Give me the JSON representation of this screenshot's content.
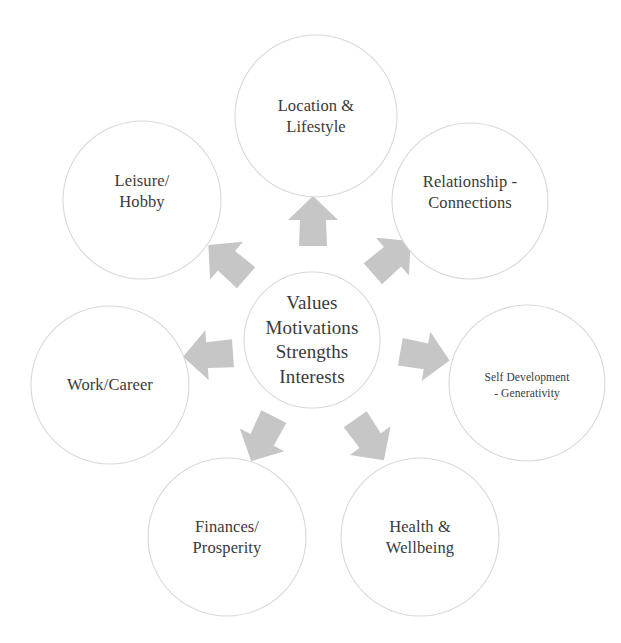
{
  "diagram": {
    "type": "radial-hub-and-spoke",
    "background_color": "#ffffff",
    "circle_stroke_color": "#d8d8d8",
    "circle_fill_color": "#ffffff",
    "arrow_fill_color": "#c6c6c6",
    "text_color": "#3a3a3a",
    "hub": {
      "label": "Values\nMotivations\nStrengths\nInterests",
      "lines": [
        "Values",
        "Motivations",
        "Strengths",
        "Interests"
      ],
      "cx": 312,
      "cy": 340,
      "r": 68
    },
    "nodes": [
      {
        "id": "location-lifestyle",
        "label": "Location &\nLifestyle",
        "lines": [
          "Location &",
          "Lifestyle"
        ],
        "cx": 316,
        "cy": 116,
        "r": 81,
        "text_size": "normal",
        "label_dy": 0
      },
      {
        "id": "relationship-connections",
        "label": "Relationship -\nConnections",
        "lines": [
          "Relationship -",
          "Connections"
        ],
        "cx": 470,
        "cy": 201,
        "r": 78,
        "text_size": "normal",
        "label_dy": -9
      },
      {
        "id": "self-development-generativity",
        "label": "Self Development\n-  Generativity",
        "lines": [
          "Self Development",
          "-  Generativity"
        ],
        "cx": 527,
        "cy": 383,
        "r": 78,
        "text_size": "small",
        "label_dy": 3
      },
      {
        "id": "health-wellbeing",
        "label": "Health &\nWellbeing",
        "lines": [
          "Health &",
          "Wellbeing"
        ],
        "cx": 420,
        "cy": 537,
        "r": 79,
        "text_size": "normal",
        "label_dy": 0
      },
      {
        "id": "finances-prosperity",
        "label": "Finances/\nProsperity",
        "lines": [
          "Finances/",
          "Prosperity"
        ],
        "cx": 227,
        "cy": 537,
        "r": 79,
        "text_size": "normal",
        "label_dy": 0
      },
      {
        "id": "work-career",
        "label": "Work/Career",
        "lines": [
          "Work/Career"
        ],
        "cx": 110,
        "cy": 385,
        "r": 79,
        "text_size": "normal",
        "label_dy": 0
      },
      {
        "id": "leisure-hobby",
        "label": "Leisure/\nHobby",
        "lines": [
          "Leisure/",
          "Hobby"
        ],
        "cx": 142,
        "cy": 200,
        "r": 79,
        "text_size": "normal",
        "label_dy": -9
      }
    ],
    "arrows": [
      {
        "id": "arrow-to-location-lifestyle",
        "target": "location-lifestyle",
        "cx": 313,
        "cy": 222,
        "angle": 0,
        "scale": 1.0
      },
      {
        "id": "arrow-to-relationship-connections",
        "target": "relationship-connections",
        "cx": 391,
        "cy": 258,
        "angle": 49,
        "scale": 1.0
      },
      {
        "id": "arrow-to-self-development",
        "target": "self-development-generativity",
        "cx": 424,
        "cy": 356,
        "angle": 100,
        "scale": 1.0
      },
      {
        "id": "arrow-to-health-wellbeing",
        "target": "health-wellbeing",
        "cx": 369,
        "cy": 439,
        "angle": 145,
        "scale": 1.0
      },
      {
        "id": "arrow-to-finances-prosperity",
        "target": "finances-prosperity",
        "cx": 263,
        "cy": 438,
        "angle": 207,
        "scale": 1.0
      },
      {
        "id": "arrow-to-work-career",
        "target": "work-career",
        "cx": 209,
        "cy": 355,
        "angle": 266,
        "scale": 1.0
      },
      {
        "id": "arrow-to-leisure-hobby",
        "target": "leisure-hobby",
        "cx": 228,
        "cy": 262,
        "angle": 311,
        "scale": 1.0
      }
    ]
  }
}
